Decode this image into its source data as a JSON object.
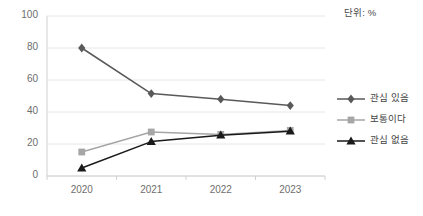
{
  "unit_note": "단위: %",
  "axis": {
    "y_ticks": [
      "100",
      "80",
      "60",
      "40",
      "20",
      "0"
    ],
    "x_ticks": [
      "2020",
      "2021",
      "2022",
      "2023"
    ]
  },
  "legend": {
    "items": [
      {
        "label": "관심 있음",
        "marker": "diamond-marker-icon",
        "color": "#595959"
      },
      {
        "label": "보통이다",
        "marker": "square-marker-icon",
        "color": "#a6a6a6"
      },
      {
        "label": "관심 없음",
        "marker": "triangle-marker-icon",
        "color": "#1a1a1a"
      }
    ]
  },
  "chart_data": {
    "type": "line",
    "title": "",
    "subtitle": "",
    "xlabel": "",
    "ylabel": "",
    "unit": "%",
    "categories": [
      "2020",
      "2021",
      "2022",
      "2023"
    ],
    "ylim": [
      0,
      100
    ],
    "ytick_step": 20,
    "grid": true,
    "legend_position": "right",
    "series": [
      {
        "name": "관심 있음",
        "values": [
          80,
          51.5,
          48,
          44
        ],
        "color": "#595959",
        "marker": "diamond"
      },
      {
        "name": "보통이다",
        "values": [
          15,
          27.5,
          26,
          28.5
        ],
        "color": "#a6a6a6",
        "marker": "square"
      },
      {
        "name": "관심 없음",
        "values": [
          5,
          21.5,
          25.5,
          28
        ],
        "color": "#1a1a1a",
        "marker": "triangle"
      }
    ]
  }
}
